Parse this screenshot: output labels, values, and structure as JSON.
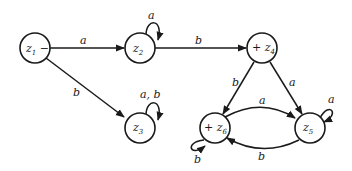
{
  "diagram": {
    "type": "finite-automaton",
    "nodes": [
      {
        "id": "z1",
        "name": "z",
        "sub": "1",
        "prefix": "",
        "suffix": " −",
        "start": true,
        "final": false
      },
      {
        "id": "z2",
        "name": "z",
        "sub": "2",
        "prefix": "",
        "suffix": "",
        "start": false,
        "final": false
      },
      {
        "id": "z3",
        "name": "z",
        "sub": "3",
        "prefix": "",
        "suffix": "",
        "start": false,
        "final": false
      },
      {
        "id": "z4",
        "name": "z",
        "sub": "4",
        "prefix": "+ ",
        "suffix": "",
        "start": false,
        "final": true
      },
      {
        "id": "z5",
        "name": "z",
        "sub": "5",
        "prefix": "",
        "suffix": "",
        "start": false,
        "final": false
      },
      {
        "id": "z6",
        "name": "z",
        "sub": "6",
        "prefix": "+ ",
        "suffix": "",
        "start": false,
        "final": true
      }
    ],
    "edges": [
      {
        "from": "z1",
        "to": "z2",
        "label": "a"
      },
      {
        "from": "z1",
        "to": "z3",
        "label": "b"
      },
      {
        "from": "z2",
        "to": "z2",
        "label": "a"
      },
      {
        "from": "z2",
        "to": "z4",
        "label": "b"
      },
      {
        "from": "z3",
        "to": "z3",
        "label": "a, b"
      },
      {
        "from": "z4",
        "to": "z6",
        "label": "b"
      },
      {
        "from": "z4",
        "to": "z5",
        "label": "a"
      },
      {
        "from": "z6",
        "to": "z5",
        "label": "a"
      },
      {
        "from": "z5",
        "to": "z6",
        "label": "b"
      },
      {
        "from": "z5",
        "to": "z5",
        "label": "a"
      },
      {
        "from": "z6",
        "to": "z6",
        "label": "b"
      }
    ]
  }
}
